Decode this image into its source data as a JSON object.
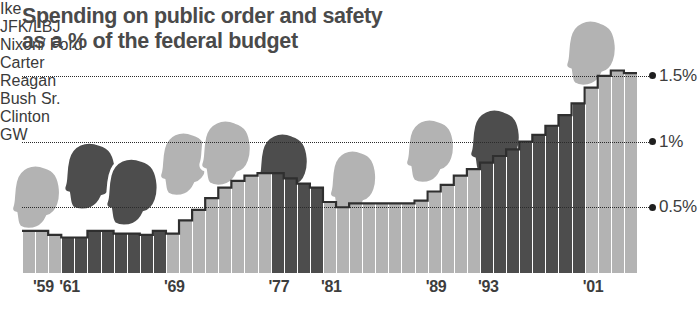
{
  "title": "Spending on public order and safety\nas a % of the federal budget",
  "colors": {
    "republican_bar": "#b3b3b3",
    "democrat_bar": "#4d4d4d",
    "outline": "#2f2f2f",
    "text": "#3d3d3d",
    "title": "#4a4a4a",
    "background": "#ffffff"
  },
  "chart_data": {
    "type": "bar",
    "title": "Spending on public order and safety as a % of the federal budget",
    "xlabel": "",
    "ylabel": "% of the federal budget",
    "ylim": [
      0,
      1.62
    ],
    "grid": true,
    "gridlines": [
      0.5,
      1.0,
      1.5
    ],
    "ytick_labels": [
      "0.5%",
      "1%",
      "1.5%"
    ],
    "xtick_labels": [
      "'59",
      "'61",
      "'69",
      "'77",
      "'81",
      "'89",
      "'93",
      "'01"
    ],
    "xtick_years": [
      1959,
      1961,
      1969,
      1977,
      1981,
      1989,
      1993,
      2001
    ],
    "legend": "none",
    "categories": [
      1958,
      1959,
      1960,
      1961,
      1962,
      1963,
      1964,
      1965,
      1966,
      1967,
      1968,
      1969,
      1970,
      1971,
      1972,
      1973,
      1974,
      1975,
      1976,
      1977,
      1978,
      1979,
      1980,
      1981,
      1982,
      1983,
      1984,
      1985,
      1986,
      1987,
      1988,
      1989,
      1990,
      1991,
      1992,
      1993,
      1994,
      1995,
      1996,
      1997,
      1998,
      1999,
      2000,
      2001,
      2002,
      2003,
      2004
    ],
    "values": [
      0.32,
      0.32,
      0.29,
      0.27,
      0.27,
      0.32,
      0.32,
      0.3,
      0.3,
      0.29,
      0.32,
      0.3,
      0.4,
      0.48,
      0.57,
      0.65,
      0.7,
      0.74,
      0.76,
      0.76,
      0.72,
      0.68,
      0.65,
      0.54,
      0.5,
      0.53,
      0.53,
      0.53,
      0.53,
      0.53,
      0.55,
      0.62,
      0.67,
      0.74,
      0.79,
      0.84,
      0.89,
      0.94,
      1.0,
      1.05,
      1.12,
      1.2,
      1.29,
      1.41,
      1.5,
      1.54,
      1.52
    ],
    "party": [
      "R",
      "R",
      "R",
      "D",
      "D",
      "D",
      "D",
      "D",
      "D",
      "D",
      "D",
      "R",
      "R",
      "R",
      "R",
      "R",
      "R",
      "R",
      "R",
      "D",
      "D",
      "D",
      "D",
      "R",
      "R",
      "R",
      "R",
      "R",
      "R",
      "R",
      "R",
      "R",
      "R",
      "R",
      "R",
      "D",
      "D",
      "D",
      "D",
      "D",
      "D",
      "D",
      "D",
      "R",
      "R",
      "R",
      "R"
    ]
  },
  "presidents": [
    {
      "name": "Ike",
      "party": "R",
      "label_x": 18,
      "label_y": 148,
      "head_x": 10,
      "head_y": 163,
      "head_w": 54,
      "head_h": 68,
      "flip": false
    },
    {
      "name": "JFK/LBJ",
      "party": "D",
      "label_x": 80,
      "label_y": 131,
      "head_x": 62,
      "head_y": 140,
      "head_w": 58,
      "head_h": 72,
      "flip": false
    },
    {
      "name": "",
      "party": "D",
      "label_x": 0,
      "label_y": 0,
      "head_x": 104,
      "head_y": 156,
      "head_w": 58,
      "head_h": 72,
      "flip": false
    },
    {
      "name": "Nixon/\nFord",
      "party": "R",
      "label_x": 161,
      "label_y": 106,
      "head_x": 158,
      "head_y": 130,
      "head_w": 54,
      "head_h": 68,
      "flip": false
    },
    {
      "name": "",
      "party": "R",
      "label_x": 0,
      "label_y": 0,
      "head_x": 199,
      "head_y": 118,
      "head_w": 56,
      "head_h": 70,
      "flip": false
    },
    {
      "name": "Carter",
      "party": "D",
      "label_x": 259,
      "label_y": 117,
      "head_x": 256,
      "head_y": 131,
      "head_w": 56,
      "head_h": 70,
      "flip": false
    },
    {
      "name": "Reagan",
      "party": "R",
      "label_x": 328,
      "label_y": 131,
      "head_x": 328,
      "head_y": 148,
      "head_w": 52,
      "head_h": 68,
      "flip": false
    },
    {
      "name": "Bush Sr.",
      "party": "R",
      "label_x": 399,
      "label_y": 99,
      "head_x": 404,
      "head_y": 117,
      "head_w": 54,
      "head_h": 68,
      "flip": false
    },
    {
      "name": "Clinton",
      "party": "D",
      "label_x": 470,
      "label_y": 93,
      "head_x": 468,
      "head_y": 107,
      "head_w": 56,
      "head_h": 70,
      "flip": false
    },
    {
      "name": "GW",
      "party": "R",
      "label_x": 620,
      "label_y": 10,
      "head_x": 564,
      "head_y": 18,
      "head_w": 56,
      "head_h": 70,
      "flip": false
    }
  ]
}
